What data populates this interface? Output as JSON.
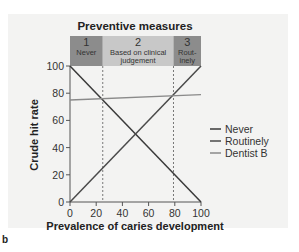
{
  "panel_letter": "b",
  "chart_data": {
    "type": "line",
    "title": "Preventive measures",
    "xlabel": "Prevalence of caries development",
    "ylabel": "Crude hit rate",
    "xlim": [
      0,
      100
    ],
    "ylim": [
      0,
      100
    ],
    "xticks": [
      0,
      20,
      40,
      60,
      80,
      100
    ],
    "yticks": [
      0,
      20,
      40,
      60,
      80,
      100
    ],
    "grid": false,
    "legend_position": "right",
    "series": [
      {
        "name": "Never",
        "color": "#3a3a3a",
        "x": [
          0,
          100
        ],
        "y": [
          100,
          0
        ]
      },
      {
        "name": "Routinely",
        "color": "#4a4a4a",
        "x": [
          0,
          100
        ],
        "y": [
          0,
          100
        ]
      },
      {
        "name": "Dentist B",
        "color": "#8a8a8a",
        "x": [
          0,
          100
        ],
        "y": [
          75,
          79
        ]
      }
    ],
    "thresholds": [
      {
        "x": 25,
        "style": "dashed"
      },
      {
        "x": 79,
        "style": "dashed"
      }
    ],
    "zones": [
      {
        "number": "1",
        "label_lines": [
          "Never"
        ],
        "x_start": 0,
        "x_end": 25,
        "color": "#8c8c8c"
      },
      {
        "number": "2",
        "label_lines": [
          "Based on clinical",
          "judgement"
        ],
        "x_start": 25,
        "x_end": 79,
        "color": "#c8c8c8"
      },
      {
        "number": "3",
        "label_lines": [
          "Rout-",
          "inely"
        ],
        "x_start": 79,
        "x_end": 100,
        "color": "#8c8c8c"
      }
    ]
  }
}
